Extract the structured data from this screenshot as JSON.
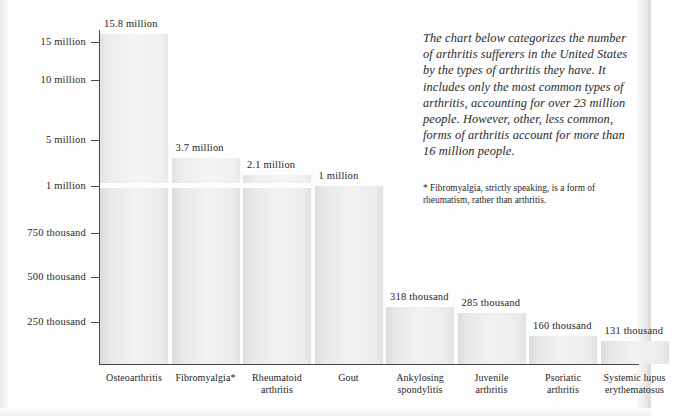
{
  "intro_text": "The chart below categorizes the number of arthritis sufferers in the United States by the types of arthritis they have. It includes only the most common types of arthritis, accounting for over 23 million people. However, other, less common, forms of arthritis account for more than 16 million people.",
  "footnote": "* Fibromyalgia, strictly speaking, is a form of rheumatism, rather than arthritis.",
  "chart_data": {
    "type": "bar",
    "title": "",
    "xlabel": "",
    "ylabel": "",
    "grid": false,
    "legend": "none",
    "broken_axis": true,
    "axis_break_at": "1 million",
    "categories": [
      "Osteoarthritis",
      "Fibromyalgia*",
      "Rheumatoid arthritis",
      "Gout",
      "Ankylosing spondylitis",
      "Juvenile arthritis",
      "Psoriatic arthritis",
      "Systemic lupus erythematosus"
    ],
    "category_lines": [
      [
        "Osteoarthritis"
      ],
      [
        "Fibromyalgia*"
      ],
      [
        "Rheumatoid",
        "arthritis"
      ],
      [
        "Gout"
      ],
      [
        "Ankylosing",
        "spondylitis"
      ],
      [
        "Juvenile",
        "arthritis"
      ],
      [
        "Psoriatic",
        "arthritis"
      ],
      [
        "Systemic lupus",
        "erythematosus"
      ]
    ],
    "values": [
      15800000,
      3700000,
      2100000,
      1000000,
      318000,
      285000,
      160000,
      131000
    ],
    "value_labels": [
      "15.8 million",
      "3.7 million",
      "2.1 million",
      "1 million",
      "318 thousand",
      "285 thousand",
      "160 thousand",
      "131 thousand"
    ],
    "y_ticks": [
      {
        "label": "15 million",
        "value": 15000000
      },
      {
        "label": "10 million",
        "value": 10000000
      },
      {
        "label": "5 million",
        "value": 5000000
      },
      {
        "label": "1 million",
        "value": 1000000
      },
      {
        "label": "750 thousand",
        "value": 750000
      },
      {
        "label": "500 thousand",
        "value": 500000
      },
      {
        "label": "250 thousand",
        "value": 250000
      }
    ],
    "colors": {
      "bar_fill": "#f0f0f0",
      "bar_edge": "#dcdcdc",
      "axis": "#4a4a4a",
      "text": "#1f1f1f",
      "background": "#fdfdfd"
    }
  }
}
